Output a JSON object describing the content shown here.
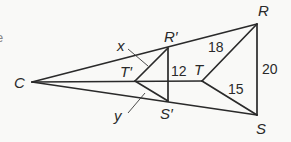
{
  "diagram": {
    "type": "similar-triangles-dilation",
    "center": "C",
    "points": {
      "C": "C",
      "R": "R",
      "S": "S",
      "T": "T",
      "R_prime": "R′",
      "S_prime": "S′",
      "T_prime": "T′"
    },
    "segment_labels": {
      "RT": "18",
      "ST": "15",
      "RS": "20",
      "R_prime_S_prime": "12"
    },
    "unknowns": {
      "x": "x",
      "y": "y"
    },
    "edge_fragment": "e"
  }
}
